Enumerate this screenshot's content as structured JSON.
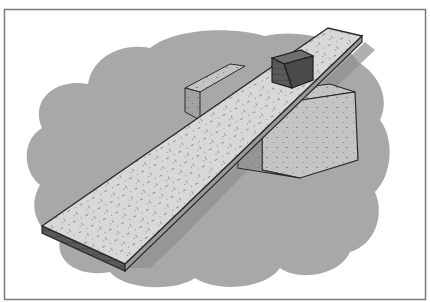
{
  "image": {
    "description": "Illustration of an inclined plane: a long speckled board resting on a stone block, with a small dark cube sitting near the raised end",
    "alt": "Inclined plane with block"
  },
  "colors": {
    "background": "#ffffff",
    "frame_border": "#7a7a7a",
    "cloud": "#a8a8a8",
    "plank_top": "#d6d6d6",
    "plank_edge": "#3a3a3a",
    "block_top": "#c9c9c9",
    "block_front": "#9a9a9a",
    "block_side": "#b4b4b4",
    "cube_top": "#6e6e6e",
    "cube_front": "#555555",
    "cube_side": "#4a4a4a",
    "outline": "#2a2a2a",
    "shadow": "#8c8c8c"
  }
}
